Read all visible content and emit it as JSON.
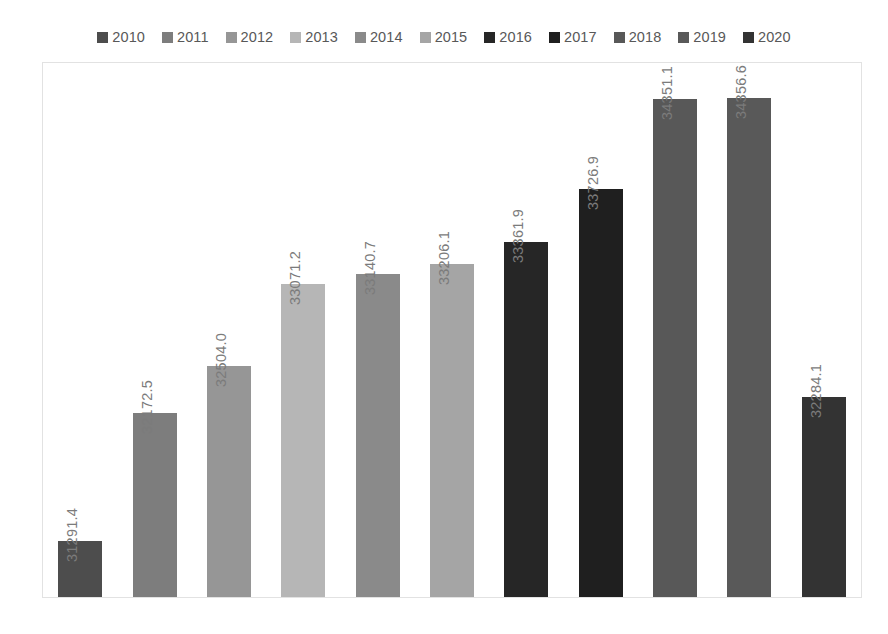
{
  "chart_data": {
    "type": "bar",
    "title": "",
    "subtitle": "",
    "xlabel": "",
    "ylabel": "",
    "categories": [
      "2010",
      "2011",
      "2012",
      "2013",
      "2014",
      "2015",
      "2016",
      "2017",
      "2018",
      "2019",
      "2020"
    ],
    "values": [
      31291.4,
      32172.5,
      32504.0,
      33071.2,
      33140.7,
      33206.1,
      33361.9,
      33726.9,
      34351.1,
      34356.6,
      32284.1
    ],
    "value_labels": [
      "31291.4",
      "32172.5",
      "32504.0",
      "33071.2",
      "33140.7",
      "33206.1",
      "33361.9",
      "33726.9",
      "34351.1",
      "34356.6",
      "32284.1"
    ],
    "series": [
      {
        "name": "value",
        "values": [
          31291.4,
          32172.5,
          32504.0,
          33071.2,
          33140.7,
          33206.1,
          33361.9,
          33726.9,
          34351.1,
          34356.6,
          32284.1
        ]
      }
    ],
    "colors": [
      "#4d4d4d",
      "#7d7d7d",
      "#969696",
      "#b6b6b6",
      "#8a8a8a",
      "#a5a5a5",
      "#262626",
      "#1f1f1f",
      "#585858",
      "#595959",
      "#333333"
    ],
    "ylim": [
      30900,
      34600
    ],
    "grid": false,
    "legend_position": "top",
    "axis_labels_visible": false,
    "data_labels_rotation": -90
  },
  "legend": {
    "items": [
      {
        "label": "2010",
        "color": "#4d4d4d"
      },
      {
        "label": "2011",
        "color": "#7d7d7d"
      },
      {
        "label": "2012",
        "color": "#969696"
      },
      {
        "label": "2013",
        "color": "#b6b6b6"
      },
      {
        "label": "2014",
        "color": "#8a8a8a"
      },
      {
        "label": "2015",
        "color": "#a5a5a5"
      },
      {
        "label": "2016",
        "color": "#262626"
      },
      {
        "label": "2017",
        "color": "#1f1f1f"
      },
      {
        "label": "2018",
        "color": "#585858"
      },
      {
        "label": "2019",
        "color": "#595959"
      },
      {
        "label": "2020",
        "color": "#333333"
      }
    ]
  },
  "plot": {
    "border_color": "#e2e2e2",
    "background": "#ffffff"
  }
}
